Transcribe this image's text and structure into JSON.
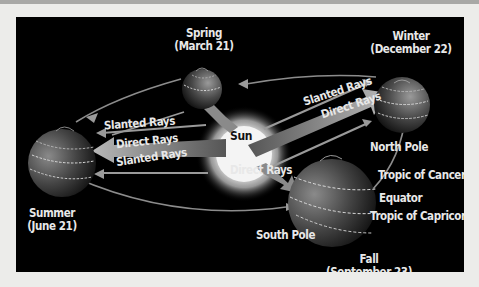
{
  "diagram": {
    "center": {
      "label": "Sun"
    },
    "seasons": {
      "spring": {
        "name": "Spring",
        "date": "(March 21)"
      },
      "winter": {
        "name": "Winter",
        "date": "(December 22)"
      },
      "summer": {
        "name": "Summer",
        "date": "(June 21)"
      },
      "fall": {
        "name": "Fall",
        "date": "(September 23)"
      }
    },
    "rays": {
      "left_slanted_top": "Slanted Rays",
      "left_direct": "Direct Rays",
      "left_slanted_bottom": "Slanted Rays",
      "right_slanted": "Slanted Rays",
      "right_direct": "Direct Rays",
      "fall_direct": "Direct Rays"
    },
    "globe_labels": {
      "north_pole": "North Pole",
      "tropic_cancer": "Tropic of Cancer",
      "equator": "Equator",
      "tropic_capricorn": "Tropic of Capricorn",
      "south_pole": "South Pole"
    },
    "colors": {
      "background": "#000000",
      "page": "#ececea",
      "text": "#e8e8e8",
      "arrow": "#9a9a9a",
      "sun_core": "#ffffff"
    }
  }
}
